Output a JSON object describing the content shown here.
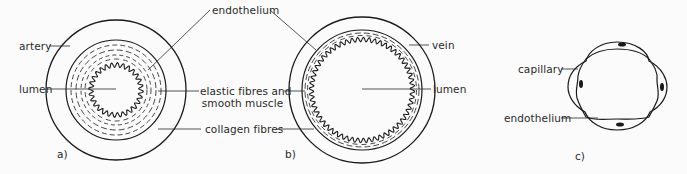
{
  "figure": {
    "panels": [
      {
        "id": "a",
        "caption": "a)",
        "subject": "artery",
        "labels": {
          "vessel": "artery",
          "lumen": "lumen",
          "endothelium": "endothelium",
          "elastic_line1": "elastic fibres and",
          "elastic_line2": "smooth muscle",
          "collagen": "collagen fibres"
        }
      },
      {
        "id": "b",
        "caption": "b)",
        "subject": "vein",
        "labels": {
          "vessel": "vein",
          "lumen": "lumen"
        }
      },
      {
        "id": "c",
        "caption": "c)",
        "subject": "capillary",
        "labels": {
          "vessel": "capillary",
          "endothelium": "endothelium"
        }
      }
    ],
    "shared_labels": {
      "endothelium": "endothelium",
      "elastic_line1": "elastic fibres and",
      "elastic_line2": "smooth muscle",
      "collagen": "collagen fibres"
    },
    "colors": {
      "stroke": "#1a1a1a",
      "text": "#2a2a2a",
      "background": "#fbfbfb"
    }
  }
}
